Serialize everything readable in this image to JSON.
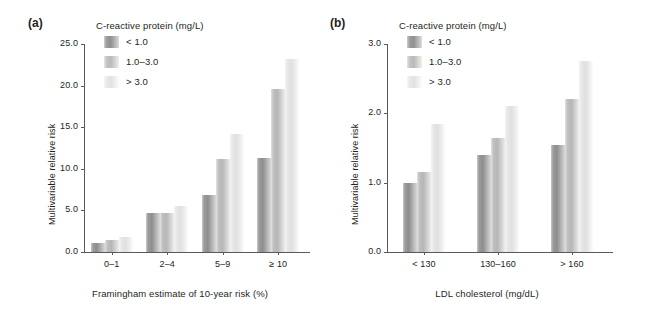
{
  "figure": {
    "background": "#ffffff",
    "text_color": "#231f20",
    "axis_color": "#58595b"
  },
  "panels": [
    {
      "label": "(a)",
      "legend_title": "C-reactive protein (mg/L)",
      "ylabel": "Multivariable relative risk",
      "xlabel": "Framingham estimate of 10-year risk (%)",
      "ytick_labels": [
        "0.0",
        "5.0",
        "10.0",
        "15.0",
        "20.0",
        "25.0"
      ],
      "xtick_labels": [
        "0–1",
        "2–4",
        "5–9",
        "≥ 10"
      ],
      "series_labels": [
        "< 1.0",
        "1.0–3.0",
        "> 3.0"
      ]
    },
    {
      "label": "(b)",
      "legend_title": "C-reactive protein (mg/L)",
      "ylabel": "Multivariable relative risk",
      "xlabel": "LDL cholesterol (mg/dL)",
      "ytick_labels": [
        "0.0",
        "1.0",
        "2.0",
        "3.0"
      ],
      "xtick_labels": [
        "< 130",
        "130–160",
        "> 160"
      ],
      "series_labels": [
        "< 1.0",
        "1.0–3.0",
        "> 3.0"
      ]
    }
  ],
  "chart_data": [
    {
      "type": "bar",
      "panel": "(a)",
      "title": "",
      "xlabel": "Framingham estimate of 10-year risk (%)",
      "ylabel": "Multivariable relative risk",
      "categories": [
        "0–1",
        "2–4",
        "5–9",
        "≥ 10"
      ],
      "series": [
        {
          "name": "< 1.0",
          "color": "#8e8e8e",
          "values": [
            1.1,
            4.7,
            6.8,
            11.3
          ]
        },
        {
          "name": "1.0–3.0",
          "color": "#b6b6b6",
          "values": [
            1.4,
            4.7,
            11.2,
            19.6
          ]
        },
        {
          "name": "> 3.0",
          "color": "#e0e0e0",
          "values": [
            1.8,
            5.5,
            14.2,
            23.2
          ]
        }
      ],
      "ylim": [
        0.0,
        25.0
      ],
      "ytick_values": [
        0.0,
        5.0,
        10.0,
        15.0,
        20.0,
        25.0
      ],
      "grid": false,
      "legend_position": "top-left",
      "legend_title": "C-reactive protein (mg/L)"
    },
    {
      "type": "bar",
      "panel": "(b)",
      "title": "",
      "xlabel": "LDL cholesterol (mg/dL)",
      "ylabel": "Multivariable relative risk",
      "categories": [
        "< 130",
        "130–160",
        "> 160"
      ],
      "series": [
        {
          "name": "< 1.0",
          "color": "#8e8e8e",
          "values": [
            1.0,
            1.4,
            1.55
          ]
        },
        {
          "name": "1.0–3.0",
          "color": "#b6b6b6",
          "values": [
            1.15,
            1.65,
            2.2
          ]
        },
        {
          "name": "> 3.0",
          "color": "#e0e0e0",
          "values": [
            1.85,
            2.1,
            2.75
          ]
        }
      ],
      "ylim": [
        0.0,
        3.0
      ],
      "ytick_values": [
        0.0,
        1.0,
        2.0,
        3.0
      ],
      "grid": false,
      "legend_position": "top-left",
      "legend_title": "C-reactive protein (mg/L)"
    }
  ]
}
